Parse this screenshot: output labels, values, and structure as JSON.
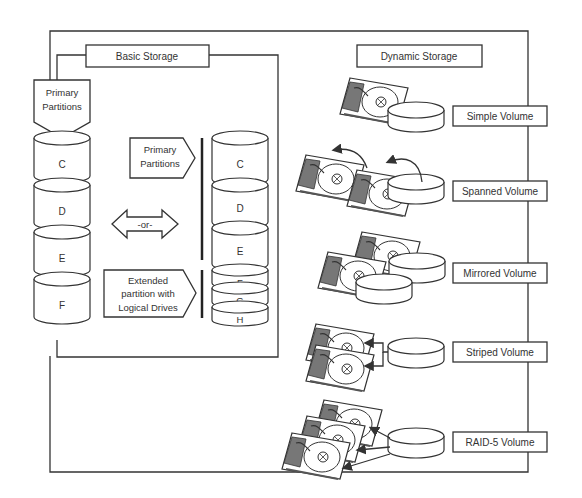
{
  "basic_storage": {
    "title": "Basic Storage",
    "left_callout": {
      "line1": "Primary",
      "line2": "Partitions"
    },
    "left_disks": [
      "C",
      "D",
      "E",
      "F"
    ],
    "or_arrow": "-or-",
    "primary_callout": {
      "line1": "Primary",
      "line2": "Partitions"
    },
    "extended_callout": {
      "line1": "Extended",
      "line2": "partition with",
      "line3": "Logical Drives"
    },
    "right_disks": [
      "C",
      "D",
      "E",
      "F",
      "G",
      "H"
    ]
  },
  "dynamic_storage": {
    "title": "Dynamic Storage",
    "volumes": [
      {
        "label": "Simple Volume"
      },
      {
        "label": "Spanned Volume"
      },
      {
        "label": "Mirrored Volume"
      },
      {
        "label": "Striped Volume"
      },
      {
        "label": "RAID-5 Volume"
      }
    ]
  }
}
